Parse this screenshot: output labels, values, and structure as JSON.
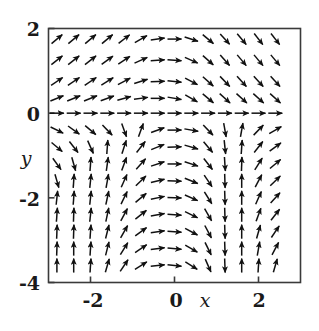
{
  "figure": {
    "kind": "direction-field",
    "background": "#ffffff",
    "ink": "#1a1a1a"
  },
  "chart_data": {
    "type": "scatter",
    "subtype": "vector-field",
    "title": "",
    "xlabel": "x",
    "ylabel": "y",
    "xlim": [
      -3.0,
      3.0
    ],
    "ylim": [
      -4.0,
      2.0
    ],
    "xticks": [
      -2,
      0,
      2
    ],
    "xticklabels": [
      "-2",
      "0",
      "2"
    ],
    "yticks": [
      2,
      0,
      -2,
      -4
    ],
    "yticklabels": [
      "2",
      "0",
      "-2",
      "-4"
    ],
    "grid": false,
    "legend": null,
    "frame": true,
    "arrow_color": "#111111",
    "arrow_length_px": 14,
    "grid_nx": 14,
    "grid_ny": 16,
    "x_values": [
      -2.8,
      -2.4,
      -2.0,
      -1.6,
      -1.2,
      -0.8,
      -0.4,
      0.0,
      0.4,
      0.8,
      1.2,
      1.6,
      2.0,
      2.4
    ],
    "y_values": [
      1.75,
      1.25,
      0.75,
      0.35,
      0.0,
      -0.4,
      -0.8,
      -1.2,
      -1.6,
      -2.0,
      -2.4,
      -2.8,
      -3.2,
      -3.6
    ],
    "series": [
      {
        "name": "row y=1.75",
        "angles_deg": [
          40,
          40,
          40,
          40,
          38,
          30,
          8,
          0,
          -18,
          -40,
          -48,
          -50,
          -52,
          -52
        ]
      },
      {
        "name": "row y=1.25",
        "angles_deg": [
          38,
          38,
          38,
          36,
          34,
          24,
          4,
          -4,
          -24,
          -42,
          -48,
          -50,
          -50,
          -50
        ]
      },
      {
        "name": "row y=0.75",
        "angles_deg": [
          34,
          34,
          34,
          32,
          28,
          18,
          2,
          -6,
          -28,
          -42,
          -46,
          -48,
          -48,
          -48
        ]
      },
      {
        "name": "row y=0.35",
        "angles_deg": [
          22,
          22,
          22,
          20,
          16,
          8,
          0,
          -10,
          -30,
          -40,
          -42,
          -42,
          -42,
          -42
        ]
      },
      {
        "name": "row y=0.0",
        "angles_deg": [
          0,
          0,
          0,
          0,
          0,
          0,
          0,
          0,
          0,
          0,
          0,
          0,
          0,
          0
        ]
      },
      {
        "name": "row y=-0.4",
        "angles_deg": [
          -26,
          -36,
          -40,
          -46,
          -70,
          70,
          20,
          0,
          -10,
          -46,
          -80,
          80,
          46,
          30
        ]
      },
      {
        "name": "row y=-0.8",
        "angles_deg": [
          -40,
          -52,
          -66,
          86,
          72,
          52,
          22,
          2,
          -16,
          -50,
          -84,
          86,
          52,
          36
        ]
      },
      {
        "name": "row y=-1.2",
        "angles_deg": [
          -54,
          -74,
          86,
          82,
          70,
          48,
          18,
          0,
          -18,
          -52,
          -86,
          88,
          58,
          40
        ]
      },
      {
        "name": "row y=-1.6",
        "angles_deg": [
          -74,
          86,
          84,
          80,
          66,
          44,
          14,
          -2,
          -22,
          -56,
          -88,
          90,
          62,
          44
        ]
      },
      {
        "name": "row y=-2.0",
        "angles_deg": [
          84,
          86,
          84,
          78,
          64,
          40,
          12,
          -2,
          -24,
          -58,
          -88,
          90,
          66,
          48
        ]
      },
      {
        "name": "row y=-2.4",
        "angles_deg": [
          86,
          88,
          84,
          78,
          62,
          38,
          10,
          -4,
          -26,
          -60,
          -88,
          90,
          70,
          52
        ]
      },
      {
        "name": "row y=-2.8",
        "angles_deg": [
          88,
          88,
          86,
          76,
          60,
          36,
          8,
          -4,
          -28,
          -62,
          -88,
          90,
          74,
          56
        ]
      },
      {
        "name": "row y=-3.2",
        "angles_deg": [
          88,
          90,
          86,
          76,
          58,
          34,
          8,
          -6,
          -30,
          -64,
          -88,
          90,
          80,
          62
        ]
      },
      {
        "name": "row y=-3.6",
        "angles_deg": [
          90,
          90,
          86,
          74,
          56,
          32,
          6,
          -6,
          -32,
          -66,
          -88,
          90,
          86,
          74
        ]
      }
    ]
  },
  "axes": {
    "x_axis_label": "x",
    "y_axis_label": "y",
    "x_tick_labels": [
      "-2",
      "0",
      "2"
    ],
    "y_tick_labels": [
      "2",
      "0",
      "-2",
      "-4"
    ]
  }
}
